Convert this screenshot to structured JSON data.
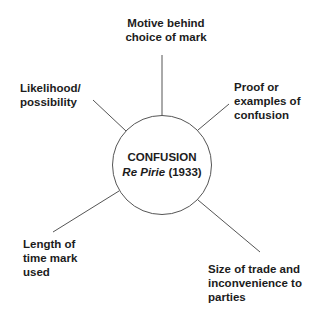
{
  "diagram": {
    "center": {
      "title": "CONFUSION",
      "case_name": "Re Pirie",
      "case_year": "(1933)"
    },
    "factors": [
      {
        "id": "motive",
        "label": "Motive behind\nchoice of mark"
      },
      {
        "id": "likelihood",
        "label": "Likelihood/\npossibility"
      },
      {
        "id": "proof",
        "label": "Proof or\nexamples of\nconfusion"
      },
      {
        "id": "length",
        "label": "Length of\ntime mark\nused"
      },
      {
        "id": "size",
        "label": "Size of trade and\ninconvenience to\nparties"
      }
    ],
    "colors": {
      "line": "#555555",
      "text": "#1c1c1c",
      "background": "#ffffff"
    }
  }
}
